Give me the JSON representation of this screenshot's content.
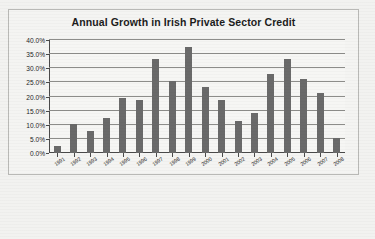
{
  "chart_data": {
    "type": "bar",
    "title": "Annual Growth in Irish Private Sector Credit",
    "xlabel": "",
    "ylabel": "",
    "ylim": [
      0,
      40
    ],
    "ytick_labels": [
      "40.0%",
      "35.0%",
      "30.0%",
      "25.0%",
      "20.0%",
      "15.0%",
      "10.0%",
      "5.0%",
      "0.0%"
    ],
    "ytick_values": [
      40,
      35,
      30,
      25,
      20,
      15,
      10,
      5,
      0
    ],
    "grid": true,
    "legend": "none",
    "categories": [
      "1991",
      "1992",
      "1993",
      "1994",
      "1995",
      "1996",
      "1997",
      "1998",
      "1999",
      "2000",
      "2001",
      "2002",
      "2003",
      "2004",
      "2005",
      "2006",
      "2007",
      "2008"
    ],
    "values": [
      2.5,
      10.3,
      7.8,
      12.4,
      19.4,
      18.8,
      33.4,
      25.6,
      37.6,
      23.4,
      18.8,
      11.4,
      14.1,
      27.8,
      33.4,
      26.1,
      21.3,
      5.3
    ],
    "bar_color": "#6a6a6a",
    "plot_background": "#f6f6f4",
    "frame_background": "#f4f4f2",
    "axis_color": "#4a4a4a",
    "gridline_color": "#8d8d8a"
  }
}
